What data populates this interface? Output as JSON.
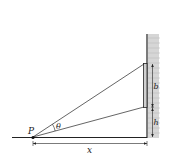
{
  "diagram": {
    "type": "geometry",
    "labels": {
      "point": "P",
      "angle": "θ",
      "painting_height": "b",
      "elevation": "h",
      "distance": "x"
    },
    "colors": {
      "line": "#222222",
      "wall_hatch": "#c8c8c8",
      "painting_fill": "#d0d0d0"
    }
  }
}
